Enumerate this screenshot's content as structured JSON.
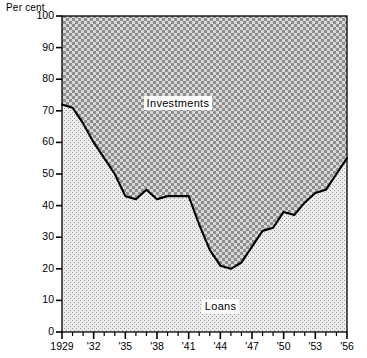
{
  "chart_data": {
    "type": "area",
    "title": "",
    "subtitle": "",
    "xlabel": "",
    "ylabel": "Per cent",
    "unit_label": "Per cent",
    "xlim": [
      1929,
      1956
    ],
    "ylim": [
      0,
      100
    ],
    "grid": false,
    "legend_position": "inside-annotations",
    "y_ticks": [
      0,
      10,
      20,
      30,
      40,
      50,
      60,
      70,
      80,
      90,
      100
    ],
    "y_tick_labels": [
      "0",
      "10",
      "20",
      "30",
      "40",
      "50",
      "60",
      "70",
      "80",
      "90",
      "100"
    ],
    "x_ticks": [
      1929,
      1932,
      1935,
      1938,
      1941,
      1944,
      1947,
      1950,
      1953,
      1956
    ],
    "x_tick_labels": [
      "1929",
      "'32",
      "'35",
      "'38",
      "'41",
      "'44",
      "'47",
      "'50",
      "'53",
      "'56"
    ],
    "x_minor_ticks": [
      1930,
      1931,
      1933,
      1934,
      1936,
      1937,
      1939,
      1940,
      1942,
      1943,
      1945,
      1946,
      1948,
      1949,
      1951,
      1952,
      1954,
      1955
    ],
    "annotations": [
      {
        "text": "Investments",
        "x": 1940,
        "y": 72
      },
      {
        "text": "Loans",
        "x": 1944,
        "y": 8
      }
    ],
    "x": [
      1929,
      1930,
      1931,
      1932,
      1933,
      1934,
      1935,
      1936,
      1937,
      1938,
      1939,
      1940,
      1941,
      1942,
      1943,
      1944,
      1945,
      1946,
      1947,
      1948,
      1949,
      1950,
      1951,
      1952,
      1953,
      1954,
      1955,
      1956
    ],
    "series": [
      {
        "name": "Loans",
        "values": [
          72,
          71,
          66,
          60,
          55,
          50,
          43,
          42,
          45,
          42,
          43,
          43,
          43,
          34,
          26,
          21,
          20,
          22,
          27,
          32,
          33,
          38,
          37,
          41,
          44,
          45,
          50,
          55
        ]
      },
      {
        "name": "Investments",
        "values": [
          28,
          29,
          34,
          40,
          45,
          50,
          57,
          58,
          55,
          58,
          57,
          57,
          57,
          66,
          74,
          79,
          80,
          78,
          73,
          68,
          67,
          62,
          63,
          59,
          56,
          55,
          50,
          45
        ]
      }
    ]
  },
  "axes": {
    "unit": "Per cent"
  }
}
